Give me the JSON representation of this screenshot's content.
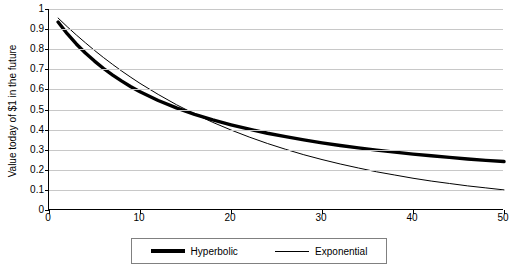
{
  "chart_data": {
    "type": "line",
    "title": "",
    "xlabel": "",
    "ylabel": "Value today of $1 in the future",
    "xlim": [
      0,
      50
    ],
    "ylim": [
      0,
      1
    ],
    "grid": true,
    "legend_position": "bottom",
    "y_ticks": [
      "0",
      "0.1",
      "0.2",
      "0.3",
      "0.4",
      "0.5",
      "0.6",
      "0.7",
      "0.8",
      "0.9",
      "1"
    ],
    "x_ticks": [
      "0",
      "10",
      "20",
      "30",
      "40",
      "50"
    ],
    "series": [
      {
        "name": "Hyperbolic",
        "style": "thick",
        "x": [
          1,
          2,
          3,
          4,
          5,
          6,
          7,
          8,
          9,
          10,
          12,
          14,
          16,
          18,
          20,
          22,
          24,
          26,
          28,
          30,
          32,
          34,
          36,
          38,
          40,
          42,
          44,
          46,
          48,
          50
        ],
        "y": [
          0.935,
          0.877,
          0.826,
          0.781,
          0.741,
          0.704,
          0.671,
          0.641,
          0.613,
          0.588,
          0.545,
          0.508,
          0.476,
          0.448,
          0.424,
          0.402,
          0.382,
          0.365,
          0.349,
          0.334,
          0.321,
          0.309,
          0.298,
          0.288,
          0.278,
          0.27,
          0.262,
          0.254,
          0.247,
          0.241
        ]
      },
      {
        "name": "Exponential",
        "style": "thin",
        "x": [
          1,
          2,
          3,
          4,
          5,
          6,
          7,
          8,
          9,
          10,
          12,
          14,
          16,
          18,
          20,
          22,
          24,
          26,
          28,
          30,
          32,
          34,
          36,
          38,
          40,
          42,
          44,
          46,
          48,
          50
        ],
        "y": [
          0.955,
          0.912,
          0.871,
          0.832,
          0.794,
          0.758,
          0.724,
          0.691,
          0.66,
          0.63,
          0.575,
          0.524,
          0.478,
          0.436,
          0.398,
          0.363,
          0.331,
          0.302,
          0.275,
          0.251,
          0.229,
          0.209,
          0.19,
          0.174,
          0.158,
          0.144,
          0.132,
          0.12,
          0.11,
          0.1
        ]
      }
    ]
  },
  "legend": {
    "entries": [
      {
        "label": "Hyperbolic"
      },
      {
        "label": "Exponential"
      }
    ]
  }
}
